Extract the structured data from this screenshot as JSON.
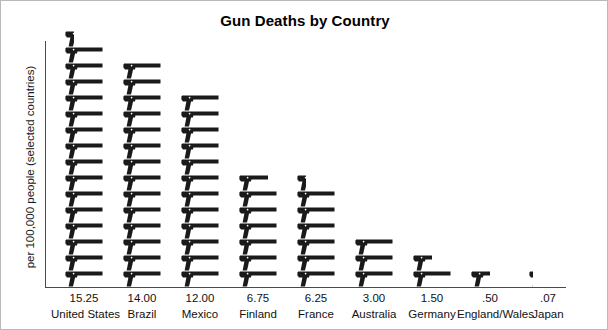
{
  "chart_data": {
    "type": "bar",
    "title": "Gun Deaths by Country",
    "xlabel": "",
    "ylabel": "per 100,000 people (selected countries)",
    "categories": [
      "United States",
      "Brazil",
      "Mexico",
      "Finland",
      "France",
      "Australia",
      "Germany",
      "England/Wales",
      "Japan"
    ],
    "values": [
      15.25,
      14.0,
      12.0,
      6.75,
      6.25,
      3.0,
      1.5,
      0.5,
      0.07
    ],
    "value_labels": [
      "15.25",
      "14.00",
      "12.00",
      "6.75",
      "6.25",
      "3.00",
      "1.50",
      ".50",
      ".07"
    ],
    "ylim": [
      0,
      16
    ],
    "grid": false,
    "legend": false,
    "pictogram": {
      "icon": "pistol-icon",
      "unit_value": 1,
      "icon_color": "#1a1a1a"
    },
    "annotations": []
  },
  "frame": {
    "border_color": "#b9b9b9",
    "background": "#ffffff",
    "axis_color": "#4a4a4a"
  }
}
